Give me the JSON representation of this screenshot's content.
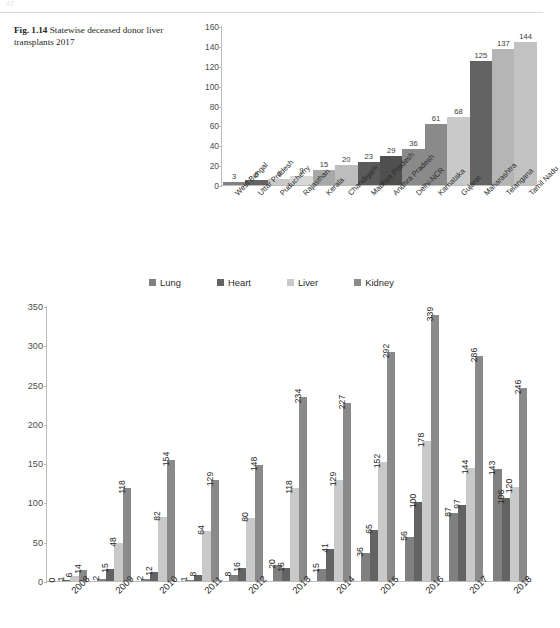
{
  "page": {
    "number": "42"
  },
  "figure1": {
    "caption_label": "Fig. 1.14",
    "caption_text": "Statewise deceased donor liver transplants 2017"
  },
  "figure2": {
    "legend_position": "top-center"
  },
  "palette": {
    "lung": "#808080",
    "heart": "#636363",
    "liver": "#c9c9c9",
    "kidney": "#8a8a8a",
    "axis": "#bcbcbc",
    "text": "#2a2a2a"
  },
  "chart_data": [
    {
      "type": "bar",
      "title": "Statewise deceased donor liver transplants 2017",
      "xlabel": "",
      "ylabel": "",
      "ylim": [
        0,
        160
      ],
      "yticks": [
        0,
        20,
        40,
        60,
        80,
        100,
        120,
        140,
        160
      ],
      "grid": false,
      "legend": false,
      "data_labels": true,
      "categories": [
        "West Bengal",
        "Uttar Pradesh",
        "Puducherry",
        "Rajasthan",
        "Kerala",
        "Chandigarh",
        "Madhya Pradesh",
        "Andhra Pradesh",
        "Delhi-NCR",
        "Karnataka",
        "Gujarat",
        "Maharashtra",
        "Telangana",
        "Tamil Nadu"
      ],
      "values": [
        3,
        5,
        6,
        9,
        15,
        20,
        23,
        29,
        36,
        61,
        68,
        125,
        137,
        144
      ],
      "bar_colors": [
        "#808080",
        "#636363",
        "#c9c9c9",
        "#d8d8d8",
        "#a8a8a8",
        "#bdbdbd",
        "#5a5a5a",
        "#4f4f4f",
        "#8a8a8a",
        "#8a8a8a",
        "#c9c9c9",
        "#636363",
        "#b5b5b5",
        "#c2c2c2"
      ]
    },
    {
      "type": "bar",
      "title": "",
      "xlabel": "",
      "ylabel": "",
      "ylim": [
        0,
        350
      ],
      "yticks": [
        0,
        50,
        100,
        150,
        200,
        250,
        300,
        350
      ],
      "grid": false,
      "legend": true,
      "legend_position": "top-center",
      "data_labels": true,
      "categories": [
        "2008",
        "2009",
        "2010",
        "2011",
        "2012",
        "2013",
        "2014",
        "2015",
        "2016",
        "2017",
        "2018"
      ],
      "series": [
        {
          "name": "Lung",
          "color": "#808080",
          "values": [
            0,
            2,
            2,
            1,
            8,
            20,
            15,
            36,
            56,
            87,
            143
          ]
        },
        {
          "name": "Heart",
          "color": "#636363",
          "values": [
            1,
            15,
            12,
            8,
            16,
            16,
            41,
            65,
            100,
            97,
            106
          ]
        },
        {
          "name": "Liver",
          "color": "#c9c9c9",
          "values": [
            6,
            48,
            82,
            64,
            80,
            118,
            129,
            152,
            178,
            144,
            120
          ]
        },
        {
          "name": "Kidney",
          "color": "#8a8a8a",
          "values": [
            14,
            118,
            154,
            129,
            148,
            234,
            227,
            292,
            339,
            286,
            246
          ]
        }
      ]
    }
  ]
}
